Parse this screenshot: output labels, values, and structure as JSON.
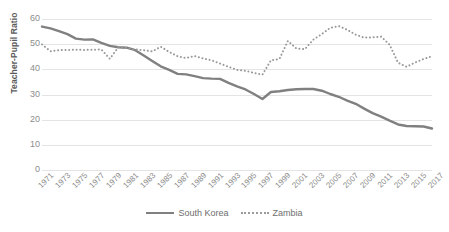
{
  "chart_data": {
    "type": "line",
    "title": "",
    "xlabel": "",
    "ylabel": "Teacher-Pupil Ratio",
    "ylim": [
      0,
      60
    ],
    "yticks": [
      0,
      10,
      20,
      30,
      40,
      50,
      60
    ],
    "grid": true,
    "legend_position": "bottom",
    "xtick_labels": [
      "1971",
      "1973",
      "1975",
      "1977",
      "1979",
      "1981",
      "1983",
      "1985",
      "1987",
      "1989",
      "1991",
      "1993",
      "1995",
      "1997",
      "1999",
      "2001",
      "2003",
      "2005",
      "2007",
      "2009",
      "2011",
      "2013",
      "2015",
      "2017"
    ],
    "x": [
      1971,
      1972,
      1973,
      1974,
      1975,
      1976,
      1977,
      1978,
      1979,
      1980,
      1981,
      1982,
      1983,
      1984,
      1985,
      1986,
      1987,
      1988,
      1989,
      1990,
      1991,
      1992,
      1993,
      1994,
      1995,
      1996,
      1997,
      1998,
      1999,
      2000,
      2001,
      2002,
      2003,
      2004,
      2005,
      2006,
      2007,
      2008,
      2009,
      2010,
      2011,
      2012,
      2013,
      2014,
      2015,
      2016,
      2017
    ],
    "series": [
      {
        "name": "South Korea",
        "style": "solid",
        "color": "#808080",
        "values": [
          57.0,
          56.3,
          55.2,
          54.0,
          52.2,
          51.8,
          51.9,
          50.5,
          49.3,
          48.8,
          48.6,
          47.6,
          45.5,
          43.3,
          41.2,
          39.8,
          38.2,
          38.0,
          37.3,
          36.5,
          36.3,
          36.2,
          34.6,
          33.2,
          32.0,
          30.2,
          28.2,
          31.0,
          31.3,
          31.8,
          32.1,
          32.2,
          32.2,
          31.5,
          30.2,
          29.1,
          27.6,
          26.3,
          24.4,
          22.6,
          21.2,
          19.6,
          18.1,
          17.5,
          17.4,
          17.3,
          16.5
        ]
      },
      {
        "name": "Zambia",
        "style": "dotted",
        "color": "#9a9a9a",
        "values": [
          49.9,
          47.2,
          47.6,
          47.7,
          47.8,
          47.7,
          47.8,
          47.9,
          44.2,
          48.8,
          48.4,
          47.9,
          47.6,
          47.1,
          49.0,
          46.9,
          45.2,
          44.5,
          45.3,
          44.3,
          43.6,
          42.3,
          41.0,
          39.8,
          39.4,
          38.6,
          37.9,
          43.6,
          44.1,
          51.3,
          48.3,
          48.0,
          51.8,
          54.0,
          56.5,
          57.2,
          55.7,
          53.8,
          52.6,
          52.7,
          53.0,
          49.8,
          42.6,
          41.0,
          42.7,
          44.1,
          45.2
        ]
      }
    ]
  },
  "legend": {
    "items": [
      {
        "label": "South Korea",
        "swatch": "solid-line-swatch"
      },
      {
        "label": "Zambia",
        "swatch": "dotted-line-swatch"
      }
    ]
  }
}
